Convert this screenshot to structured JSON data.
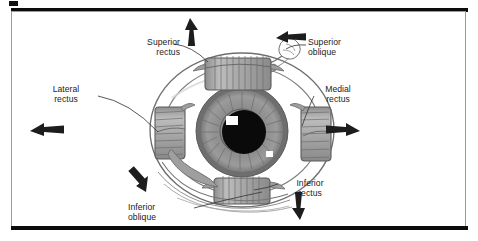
{
  "figure": {
    "kind": "anatomy-diagram",
    "view": "anterior"
  },
  "labels": {
    "superior_rectus": {
      "line1": "Superior",
      "line2": "rectus"
    },
    "superior_oblique": {
      "line1": "Superior",
      "line2": "oblique"
    },
    "lateral_rectus": {
      "line1": "Lateral",
      "line2": "rectus"
    },
    "medial_rectus": {
      "line1": "Medial",
      "line2": "rectus"
    },
    "inferior_rectus": {
      "line1": "Inferior",
      "line2": "rectus"
    },
    "inferior_oblique": {
      "line1": "Inferior",
      "line2": "oblique"
    }
  },
  "arrows": [
    {
      "name": "superior-rectus-arrow",
      "direction": "up"
    },
    {
      "name": "superior-oblique-arrow",
      "direction": "left"
    },
    {
      "name": "lateral-rectus-arrow",
      "direction": "left"
    },
    {
      "name": "medial-rectus-arrow",
      "direction": "right"
    },
    {
      "name": "inferior-rectus-arrow",
      "direction": "down"
    },
    {
      "name": "inferior-oblique-arrow",
      "direction": "down-right"
    }
  ],
  "colors": {
    "frame_rule": "#0c0c0c",
    "frame_border": "#9a9a9a",
    "muscle_fill": "#a8a8a8",
    "muscle_stroke": "#565656",
    "sclera_fill": "#ffffff",
    "sclera_stroke": "#6f6f6f",
    "iris_fill": "#8e8e8e",
    "iris_inner": "#7a7a7a",
    "pupil_fill": "#0a0a0a",
    "highlight": "#ffffff",
    "text": "#1b1b1b",
    "arrow_fill": "#1d1d1d",
    "leader_line": "#3a3a3a"
  }
}
